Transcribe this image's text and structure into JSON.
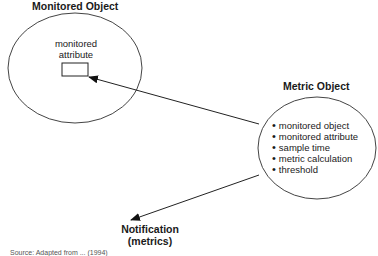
{
  "diagram": {
    "monitored_object": {
      "title": "Monitored Object",
      "attribute_label_line1": "monitored",
      "attribute_label_line2": "attribute"
    },
    "metric_object": {
      "title": "Metric Object",
      "items": [
        "monitored object",
        "monitored attribute",
        "sample time",
        "metric calculation",
        "threshold"
      ]
    },
    "notification": {
      "line1": "Notification",
      "line2": "(metrics)"
    },
    "arrows": [
      {
        "from": "metric-object",
        "to": "monitored-attribute"
      },
      {
        "from": "metric-object",
        "to": "notification"
      }
    ],
    "source_caption": "Source: Adapted from ... (1994)"
  },
  "colors": {
    "stroke": "#333333",
    "text": "#1a1a1a"
  }
}
